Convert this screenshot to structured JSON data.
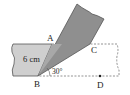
{
  "diagram": {
    "type": "geometry-folded-strip",
    "labels": {
      "A": "A",
      "B": "B",
      "C": "C",
      "D": "D",
      "width": "6 cm",
      "angle": "30°"
    },
    "colors": {
      "strip": "#cfcfcf",
      "folded": "#8f8f8f",
      "edge": "#555555",
      "dashed": "#777777"
    }
  }
}
